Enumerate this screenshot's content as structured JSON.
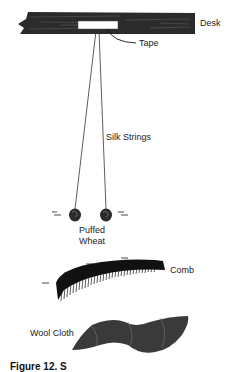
{
  "diagram": {
    "labels": {
      "desk": "Desk",
      "tape": "Tape",
      "silk_strings": "Silk Strings",
      "puffed_wheat_line1": "Puffed",
      "puffed_wheat_line2": "Wheat",
      "comb": "Comb",
      "wool_cloth": "Wool Cloth"
    },
    "caption": "Figure 12. S",
    "charges": {
      "symbol": "—",
      "sign": "negative"
    },
    "colors": {
      "ink": "#1a1a1a",
      "desk": "#2b2b2b",
      "tape": "#ffffff",
      "background": "#ffffff"
    }
  }
}
